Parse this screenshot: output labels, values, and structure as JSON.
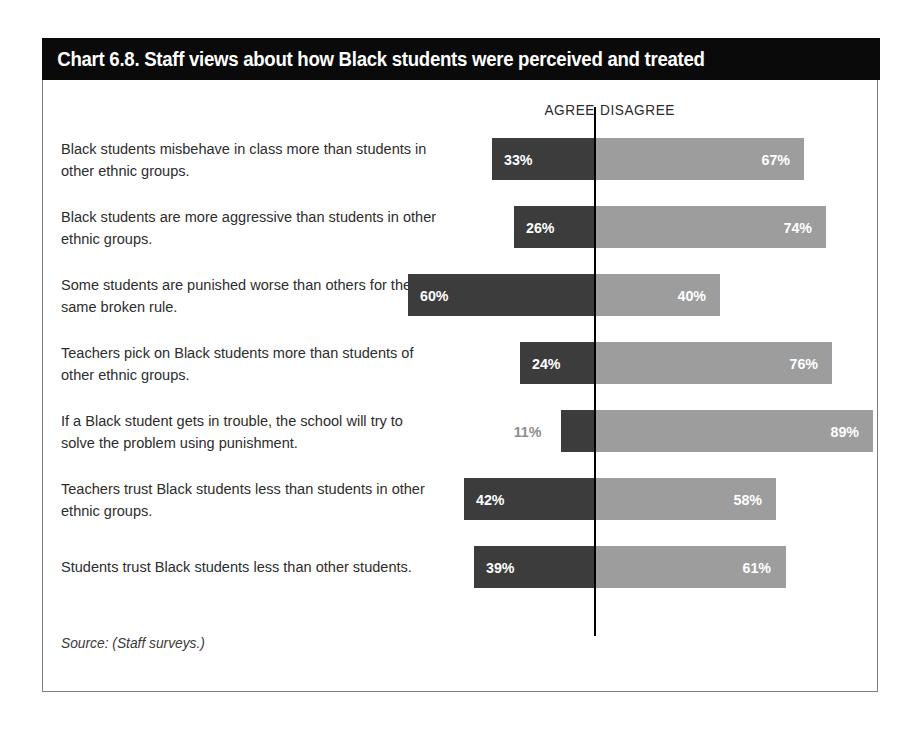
{
  "chart_data": {
    "type": "bar",
    "subtype": "diverging-stacked-bar",
    "title": "Chart 6.8. Staff views about how Black students were perceived and treated",
    "source_note": "Source: (Staff surveys.)",
    "xlabel": "",
    "ylabel": "",
    "grid": false,
    "legend_position": "top",
    "axis_center_value": 0,
    "value_suffix": "%",
    "categories": [
      "Black students misbehave in class more than students in other ethnic groups.",
      "Black students are more aggressive than students in other ethnic groups.",
      "Some students are punished worse than others for the same broken rule.",
      "Teachers pick on Black students more than students of other ethnic groups.",
      "If a Black student gets in trouble, the school will try to solve the problem using punishment.",
      "Teachers trust Black students less than students in other ethnic groups.",
      "Students trust Black students less than other students."
    ],
    "series": [
      {
        "name": "AGREE",
        "color": "#3c3c3c",
        "side": "left",
        "values": [
          33,
          26,
          60,
          24,
          11,
          42,
          39
        ],
        "labels": [
          "33%",
          "26%",
          "60%",
          "24%",
          "11%",
          "42%",
          "39%"
        ]
      },
      {
        "name": "DISAGREE",
        "color": "#9d9d9d",
        "side": "right",
        "values": [
          67,
          74,
          40,
          76,
          89,
          58,
          61
        ],
        "labels": [
          "67%",
          "74%",
          "40%",
          "76%",
          "89%",
          "58%",
          "61%"
        ]
      }
    ]
  },
  "header": {
    "title": "Chart 6.8. Staff views about how Black students were perceived and treated"
  },
  "columns": {
    "agree": "AGREE",
    "disagree": "DISAGREE"
  },
  "rows": [
    {
      "label": "Black students misbehave in class more than students in other ethnic groups.",
      "agree": 33,
      "agree_label": "33%",
      "agree_outside": false,
      "disagree": 67,
      "disagree_label": "67%"
    },
    {
      "label": "Black students are more aggressive than students in other ethnic groups.",
      "agree": 26,
      "agree_label": "26%",
      "agree_outside": false,
      "disagree": 74,
      "disagree_label": "74%"
    },
    {
      "label": "Some students are punished worse than others for the same broken rule.",
      "agree": 60,
      "agree_label": "60%",
      "agree_outside": false,
      "disagree": 40,
      "disagree_label": "40%"
    },
    {
      "label": "Teachers pick on Black students more than students of other ethnic groups.",
      "agree": 24,
      "agree_label": "24%",
      "agree_outside": false,
      "disagree": 76,
      "disagree_label": "76%"
    },
    {
      "label": "If a Black student gets in trouble, the school will try to solve the problem using punishment.",
      "agree": 11,
      "agree_label": "11%",
      "agree_outside": true,
      "disagree": 89,
      "disagree_label": "89%"
    },
    {
      "label": "Teachers trust Black students less than students in other ethnic groups.",
      "agree": 42,
      "agree_label": "42%",
      "agree_outside": false,
      "disagree": 58,
      "disagree_label": "58%"
    },
    {
      "label": "Students trust Black students less than other students.",
      "agree": 39,
      "agree_label": "39%",
      "agree_outside": false,
      "disagree": 61,
      "disagree_label": "61%"
    }
  ],
  "footer": {
    "source": "Source: (Staff surveys.)"
  },
  "colors": {
    "agree_bar": "#3c3c3c",
    "disagree_bar": "#9d9d9d",
    "title_bar": "#0a0a0a",
    "outside_label": "#8e8e8e"
  }
}
